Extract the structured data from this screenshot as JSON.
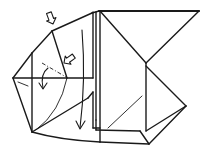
{
  "diagram": {
    "type": "origami-folding-step",
    "colors": {
      "line": "#1a1a1a",
      "background": "#ffffff"
    },
    "symbols": [
      {
        "name": "push-arrow",
        "count": 2,
        "meaning": "push / squash in"
      },
      {
        "name": "fold-arrow",
        "count": 2,
        "meaning": "fold down"
      },
      {
        "name": "dash-dot-line",
        "count": 1,
        "meaning": "mountain fold line"
      }
    ],
    "labels": []
  }
}
